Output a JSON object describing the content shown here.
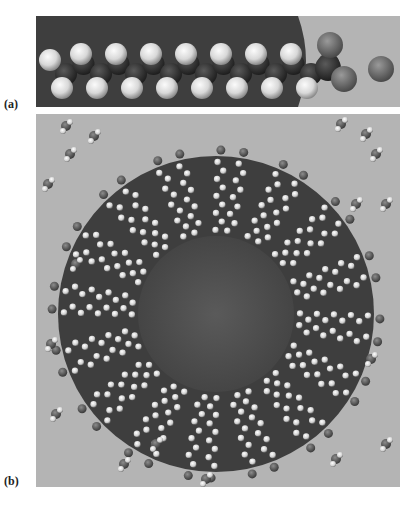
{
  "figure": {
    "panels": [
      {
        "id": "a",
        "label": "(a)",
        "description": "Single surfactant molecule: hydrocarbon chain with terminal head group and a separate counterion",
        "chain": {
          "top_hydrogens": 7,
          "bottom_hydrogens": 8,
          "terminal_hydrogen": 1,
          "head_group_oxygens": 2,
          "counterions": 1
        }
      },
      {
        "id": "b",
        "label": "(b)",
        "description": "Cross-section of a spherical micelle with radially arranged surfactant chains surrounded by water molecules",
        "micelle": {
          "radial_chain_groups": 16
        }
      }
    ],
    "colors": {
      "background": "#ffffff",
      "dark_region": "#3e3e3e",
      "light_region": "#b4b4b4",
      "hydrogen": "#e6e6e6",
      "carbon": "#2e2e2e",
      "oxygen": "#6f6f6f",
      "label_text": "#222222"
    }
  }
}
